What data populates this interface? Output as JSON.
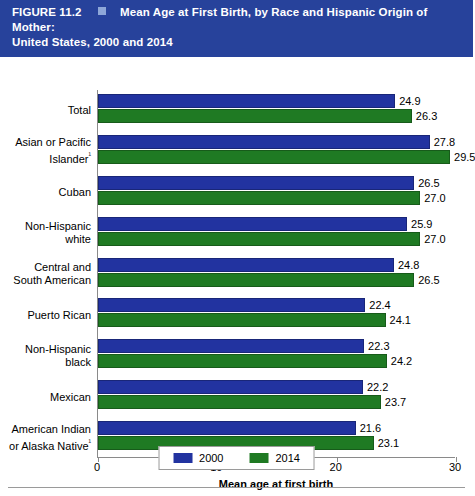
{
  "header": {
    "figure_number": "FIGURE 11.2",
    "square_icon": "square-bullet-icon",
    "title_line1": "Mean Age at First Birth, by Race and Hispanic Origin of Mother:",
    "title_line2": "United States, 2000 and 2014",
    "background_color": "#27429b"
  },
  "chart_data": {
    "type": "bar",
    "orientation": "horizontal",
    "title": "Mean Age at First Birth, by Race and Hispanic Origin of Mother: United States, 2000 and 2014",
    "xlabel": "Mean age at first birth",
    "ylabel": "",
    "xlim": [
      0,
      30
    ],
    "xticks": [
      0,
      10,
      20,
      30
    ],
    "xtick_labels": [
      "0",
      "10",
      "20",
      "30"
    ],
    "grid": false,
    "legend_position": "bottom",
    "categories": [
      "Total",
      "Asian or Pacific Islander¹",
      "Cuban",
      "Non-Hispanic white",
      "Central and South American",
      "Puerto Rican",
      "Non-Hispanic black",
      "Mexican",
      "American Indian or Alaska Native¹"
    ],
    "category_lines": [
      [
        "Total"
      ],
      [
        "Asian or Pacific",
        "Islander¹"
      ],
      [
        "Cuban"
      ],
      [
        "Non-Hispanic",
        "white"
      ],
      [
        "Central and",
        "South American"
      ],
      [
        "Puerto Rican"
      ],
      [
        "Non-Hispanic",
        "black"
      ],
      [
        "Mexican"
      ],
      [
        "American Indian",
        "or Alaska Native¹"
      ]
    ],
    "series": [
      {
        "name": "2000",
        "color": "#2233a0",
        "values": [
          24.9,
          27.8,
          26.5,
          25.9,
          24.8,
          22.4,
          22.3,
          22.2,
          21.6
        ],
        "labels": [
          "24.9",
          "27.8",
          "26.5",
          "25.9",
          "24.8",
          "22.4",
          "22.3",
          "22.2",
          "21.6"
        ]
      },
      {
        "name": "2014",
        "color": "#1f7a23",
        "values": [
          26.3,
          29.5,
          27.0,
          27.0,
          26.5,
          24.1,
          24.2,
          23.7,
          23.1
        ],
        "labels": [
          "26.3",
          "29.5",
          "27.0",
          "27.0",
          "26.5",
          "24.1",
          "24.2",
          "23.7",
          "23.1"
        ]
      }
    ]
  },
  "legend": {
    "items": [
      {
        "label": "2000",
        "color": "#2233a0"
      },
      {
        "label": "2014",
        "color": "#1f7a23"
      }
    ]
  }
}
